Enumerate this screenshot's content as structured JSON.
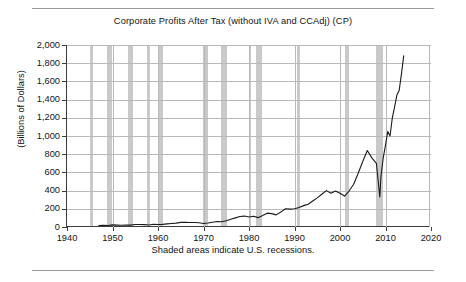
{
  "chart_data": {
    "type": "line",
    "title": "Corporate Profits After Tax (without IVA and CCAdj) (CP)",
    "ylabel": "(Billions of Dollars)",
    "xlabel": "",
    "footnote": "Shaded areas indicate U.S. recessions.",
    "xlim": [
      1940,
      2020
    ],
    "ylim": [
      0,
      2000
    ],
    "grid": true,
    "legend": false,
    "line_color": "#1a1a1a",
    "recession_color": "#c9c9c9",
    "yticks": [
      0,
      200,
      400,
      600,
      800,
      1000,
      1200,
      1400,
      1600,
      1800,
      2000
    ],
    "ytick_labels": [
      "0",
      "200",
      "400",
      "600",
      "800",
      "1,000",
      "1,200",
      "1,400",
      "1,600",
      "1,800",
      "2,000"
    ],
    "xticks": [
      1940,
      1950,
      1960,
      1970,
      1980,
      1990,
      2000,
      2010,
      2020
    ],
    "xtick_labels": [
      "1940",
      "1950",
      "1960",
      "1970",
      "1980",
      "1990",
      "2000",
      "2010",
      "2020"
    ],
    "recessions": [
      {
        "start": 1945.1,
        "end": 1945.8
      },
      {
        "start": 1948.9,
        "end": 1949.8
      },
      {
        "start": 1953.5,
        "end": 1954.4
      },
      {
        "start": 1957.6,
        "end": 1958.3
      },
      {
        "start": 1960.3,
        "end": 1961.1
      },
      {
        "start": 1969.9,
        "end": 1970.9
      },
      {
        "start": 1973.9,
        "end": 1975.2
      },
      {
        "start": 1980.0,
        "end": 1980.5
      },
      {
        "start": 1981.5,
        "end": 1982.9
      },
      {
        "start": 1990.5,
        "end": 1991.2
      },
      {
        "start": 2001.2,
        "end": 2001.9
      },
      {
        "start": 2007.9,
        "end": 2009.5
      }
    ],
    "x": [
      1947.0,
      1948.0,
      1949.0,
      1950.0,
      1951.0,
      1952.0,
      1953.0,
      1954.0,
      1955.0,
      1956.0,
      1957.0,
      1958.0,
      1959.0,
      1960.0,
      1961.0,
      1962.0,
      1963.0,
      1964.0,
      1965.0,
      1966.0,
      1967.0,
      1968.0,
      1969.0,
      1970.0,
      1971.0,
      1972.0,
      1973.0,
      1974.0,
      1975.0,
      1976.0,
      1977.0,
      1978.0,
      1979.0,
      1980.0,
      1981.0,
      1982.0,
      1983.0,
      1984.0,
      1985.0,
      1986.0,
      1987.0,
      1988.0,
      1989.0,
      1990.0,
      1991.0,
      1992.0,
      1993.0,
      1994.0,
      1995.0,
      1996.0,
      1997.0,
      1998.0,
      1999.0,
      2000.0,
      2001.0,
      2002.0,
      2003.0,
      2004.0,
      2005.0,
      2006.0,
      2007.0,
      2008.0,
      2008.75,
      2009.0,
      2009.5,
      2010.0,
      2010.5,
      2011.0,
      2011.5,
      2012.0,
      2012.5,
      2013.0,
      2013.5,
      2014.0
    ],
    "values": [
      17,
      19,
      16,
      23,
      21,
      20,
      21,
      21,
      28,
      27,
      26,
      22,
      30,
      28,
      29,
      34,
      38,
      43,
      51,
      53,
      50,
      50,
      46,
      38,
      44,
      53,
      60,
      58,
      68,
      85,
      100,
      115,
      120,
      110,
      118,
      103,
      126,
      152,
      147,
      133,
      164,
      200,
      196,
      200,
      215,
      235,
      250,
      285,
      320,
      360,
      400,
      370,
      395,
      370,
      340,
      395,
      470,
      590,
      720,
      840,
      760,
      700,
      330,
      560,
      760,
      900,
      1050,
      1000,
      1200,
      1320,
      1450,
      1500,
      1680,
      1880
    ],
    "peak_value": 1880,
    "trough_2008_value": 330
  }
}
